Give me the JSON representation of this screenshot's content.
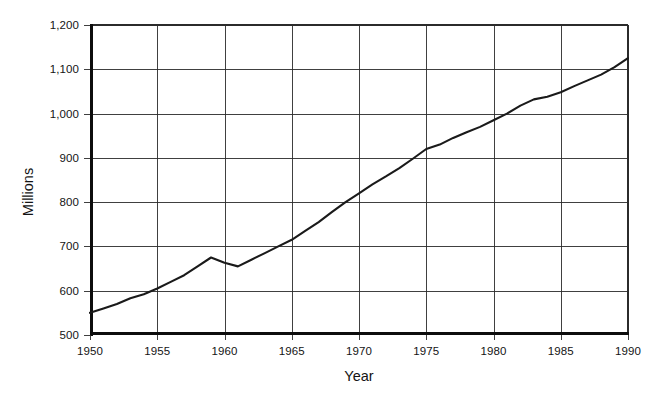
{
  "chart_data": {
    "type": "line",
    "title": "",
    "subtitle": "",
    "xlabel": "Year",
    "ylabel": "Millions",
    "xlim": [
      1950,
      1990
    ],
    "ylim": [
      500,
      1200
    ],
    "xticks": [
      1950,
      1955,
      1960,
      1965,
      1970,
      1975,
      1980,
      1985,
      1990
    ],
    "xtick_labels": [
      "1950",
      "1955",
      "1960",
      "1965",
      "1970",
      "1975",
      "1980",
      "1985",
      "1990"
    ],
    "yticks": [
      500,
      600,
      700,
      800,
      900,
      1000,
      1100,
      1200
    ],
    "ytick_labels": [
      "500",
      "600",
      "700",
      "800",
      "900",
      "1,000",
      "1,100",
      "1,200"
    ],
    "grid": true,
    "grid_axes": "both",
    "legend": false,
    "legend_position": "none",
    "line_color": "#1a1a1a",
    "background_color": "#ffffff",
    "annotations": [],
    "x": [
      1950,
      1951,
      1952,
      1953,
      1954,
      1955,
      1956,
      1957,
      1958,
      1959,
      1960,
      1961,
      1962,
      1963,
      1964,
      1965,
      1966,
      1967,
      1968,
      1969,
      1970,
      1971,
      1972,
      1973,
      1974,
      1975,
      1976,
      1977,
      1978,
      1979,
      1980,
      1981,
      1982,
      1983,
      1984,
      1985,
      1986,
      1987,
      1988,
      1989,
      1990
    ],
    "values": [
      550,
      560,
      570,
      583,
      592,
      605,
      620,
      635,
      655,
      675,
      663,
      655,
      670,
      685,
      700,
      715,
      735,
      755,
      778,
      800,
      820,
      840,
      858,
      877,
      898,
      920,
      930,
      945,
      958,
      970,
      985,
      1000,
      1018,
      1032,
      1038,
      1048,
      1062,
      1075,
      1088,
      1105,
      1125
    ],
    "series": [
      {
        "name": "Millions",
        "values": [
          550,
          560,
          570,
          583,
          592,
          605,
          620,
          635,
          655,
          675,
          663,
          655,
          670,
          685,
          700,
          715,
          735,
          755,
          778,
          800,
          820,
          840,
          858,
          877,
          898,
          920,
          930,
          945,
          958,
          970,
          985,
          1000,
          1018,
          1032,
          1038,
          1048,
          1062,
          1075,
          1088,
          1105,
          1125
        ]
      }
    ]
  },
  "plot": {
    "left": 90,
    "right": 628,
    "top": 25,
    "bottom": 335
  }
}
